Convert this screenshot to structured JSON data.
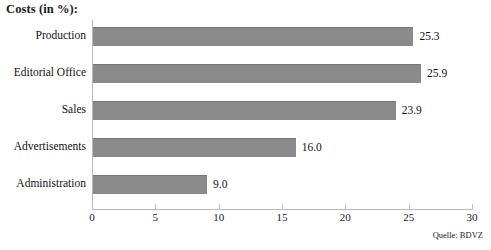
{
  "chart_data": {
    "type": "bar",
    "orientation": "horizontal",
    "title": "Costs (in %):",
    "xlabel": "",
    "ylabel": "",
    "categories": [
      "Production",
      "Editorial Office",
      "Sales",
      "Advertisements",
      "Administration"
    ],
    "values": [
      25.3,
      25.9,
      23.9,
      16.0,
      9.0
    ],
    "value_labels": [
      "25.3",
      "25.9",
      "23.9",
      "16.0",
      "9.0"
    ],
    "xlim": [
      0,
      30
    ],
    "xticks": [
      0,
      5,
      10,
      15,
      20,
      25,
      30
    ],
    "xtick_labels": [
      "0",
      "5",
      "10",
      "15",
      "20",
      "25",
      "30"
    ],
    "grid": false,
    "legend": null,
    "bar_color": "#8a8a8a",
    "axis_color": "#b9b9b9",
    "background": "#ffffff",
    "annotations": [
      "Quelle: BDVZ"
    ]
  },
  "source": {
    "text": "Quelle: BDVZ"
  }
}
